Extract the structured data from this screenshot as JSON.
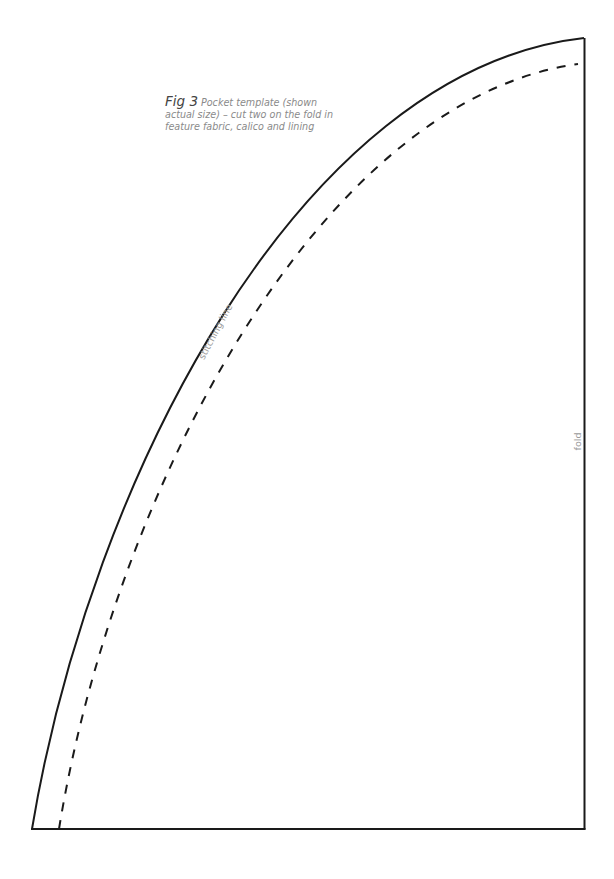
{
  "figure": {
    "label": "Fig 3",
    "caption": "Pocket template (shown actual size) – cut two on the fold in feature fabric, calico and lining"
  },
  "annotations": {
    "stitching_line": "stitching line",
    "fold": "fold"
  },
  "colors": {
    "outline": "#1a1a1a",
    "text_muted": "#8a8a8a"
  }
}
